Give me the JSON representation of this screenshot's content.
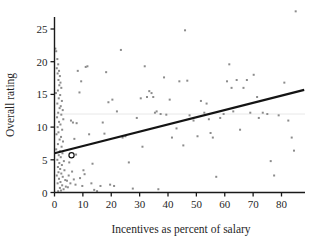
{
  "chart_data": {
    "type": "scatter",
    "title": "",
    "subtitle": "",
    "xlabel": "Incentives as percent of salary",
    "ylabel": "Overall rating",
    "xlim": [
      -1.5,
      91
    ],
    "ylim": [
      -1.2,
      28.6
    ],
    "xticks": [
      0,
      10,
      20,
      30,
      40,
      50,
      60,
      70,
      80
    ],
    "yticks": [
      0,
      5,
      10,
      15,
      20,
      25
    ],
    "xtick_labels": [
      "0",
      "10",
      "20",
      "30",
      "40",
      "50",
      "60",
      "70",
      "80"
    ],
    "ytick_labels": [
      "0",
      "5",
      "10",
      "15",
      "20",
      "25"
    ],
    "grid": false,
    "legend": null,
    "marker_color": "#8c8c8c",
    "line_color": "#1a1a1a",
    "axis_color": "#1a1a1a",
    "gridline_color": "#e2e2e2",
    "reference_line": {
      "orientation": "horizontal",
      "y": 12.0,
      "color": "#e8e8e8"
    },
    "trend_line": {
      "type": "linear-regression",
      "x_start": 0.0,
      "y_start": 6.0,
      "x_end": 88.0,
      "y_end": 15.7,
      "slope": 0.11,
      "intercept": 6.0,
      "color": "#141414",
      "width": 2.2
    },
    "highlighted_point": {
      "x": 6.0,
      "y": 5.7,
      "style": "open-circle",
      "color": "#111111"
    },
    "points": [
      [
        0.3,
        22.0
      ],
      [
        0.6,
        21.6
      ],
      [
        1.0,
        20.4
      ],
      [
        1.3,
        19.6
      ],
      [
        0.8,
        19.0
      ],
      [
        1.6,
        18.6
      ],
      [
        1.1,
        18.2
      ],
      [
        1.9,
        17.8
      ],
      [
        1.4,
        17.2
      ],
      [
        2.1,
        16.8
      ],
      [
        1.7,
        16.4
      ],
      [
        2.4,
        16.0
      ],
      [
        1.2,
        15.6
      ],
      [
        0.5,
        15.2
      ],
      [
        2.0,
        14.9
      ],
      [
        1.5,
        14.4
      ],
      [
        2.6,
        14.0
      ],
      [
        1.0,
        13.6
      ],
      [
        2.2,
        13.2
      ],
      [
        1.8,
        12.9
      ],
      [
        2.9,
        12.6
      ],
      [
        1.3,
        12.2
      ],
      [
        2.4,
        11.9
      ],
      [
        0.9,
        11.5
      ],
      [
        3.1,
        11.2
      ],
      [
        1.6,
        10.8
      ],
      [
        2.1,
        10.4
      ],
      [
        1.1,
        10.0
      ],
      [
        2.7,
        9.6
      ],
      [
        1.4,
        9.2
      ],
      [
        0.7,
        8.9
      ],
      [
        2.3,
        8.5
      ],
      [
        1.8,
        8.1
      ],
      [
        3.0,
        7.8
      ],
      [
        1.2,
        7.4
      ],
      [
        2.5,
        7.0
      ],
      [
        0.6,
        6.6
      ],
      [
        1.9,
        6.3
      ],
      [
        2.8,
        6.0
      ],
      [
        1.5,
        5.7
      ],
      [
        2.2,
        5.4
      ],
      [
        1.0,
        5.0
      ],
      [
        3.3,
        4.8
      ],
      [
        1.7,
        4.5
      ],
      [
        2.6,
        4.2
      ],
      [
        1.2,
        3.9
      ],
      [
        2.0,
        3.6
      ],
      [
        3.5,
        3.4
      ],
      [
        1.4,
        3.1
      ],
      [
        2.4,
        2.9
      ],
      [
        0.8,
        2.6
      ],
      [
        2.9,
        2.4
      ],
      [
        1.6,
        2.1
      ],
      [
        3.8,
        1.9
      ],
      [
        2.1,
        1.6
      ],
      [
        1.1,
        1.4
      ],
      [
        2.7,
        1.1
      ],
      [
        4.0,
        0.9
      ],
      [
        1.9,
        0.7
      ],
      [
        3.2,
        0.5
      ],
      [
        2.3,
        0.3
      ],
      [
        1.3,
        0.2
      ],
      [
        4.4,
        1.8
      ],
      [
        5.0,
        2.6
      ],
      [
        4.7,
        0.8
      ],
      [
        5.6,
        1.4
      ],
      [
        6.2,
        3.2
      ],
      [
        5.2,
        4.6
      ],
      [
        6.8,
        2.0
      ],
      [
        7.4,
        1.2
      ],
      [
        6.0,
        5.7
      ],
      [
        7.0,
        8.2
      ],
      [
        6.5,
        10.7
      ],
      [
        5.8,
        11.0
      ],
      [
        7.6,
        5.8
      ],
      [
        8.2,
        18.6
      ],
      [
        8.8,
        15.3
      ],
      [
        9.4,
        17.0
      ],
      [
        7.8,
        10.6
      ],
      [
        9.0,
        2.2
      ],
      [
        10.2,
        3.4
      ],
      [
        9.8,
        1.0
      ],
      [
        11.0,
        19.2
      ],
      [
        11.6,
        19.3
      ],
      [
        10.6,
        2.8
      ],
      [
        12.2,
        8.9
      ],
      [
        13.0,
        1.4
      ],
      [
        14.0,
        0.4
      ],
      [
        13.4,
        4.4
      ],
      [
        15.0,
        0.2
      ],
      [
        16.2,
        1.0
      ],
      [
        17.0,
        10.7
      ],
      [
        17.6,
        9.0
      ],
      [
        18.2,
        18.4
      ],
      [
        19.0,
        13.8
      ],
      [
        19.6,
        1.2
      ],
      [
        20.4,
        14.2
      ],
      [
        21.0,
        1.0
      ],
      [
        22.0,
        12.4
      ],
      [
        23.4,
        21.8
      ],
      [
        24.0,
        8.4
      ],
      [
        25.0,
        8.6
      ],
      [
        26.2,
        4.6
      ],
      [
        27.6,
        0.6
      ],
      [
        29.0,
        11.4
      ],
      [
        30.4,
        14.4
      ],
      [
        31.0,
        7.0
      ],
      [
        31.8,
        19.3
      ],
      [
        32.6,
        14.6
      ],
      [
        33.4,
        15.5
      ],
      [
        34.2,
        15.2
      ],
      [
        34.8,
        14.6
      ],
      [
        35.4,
        12.2
      ],
      [
        36.0,
        12.4
      ],
      [
        36.6,
        0.5
      ],
      [
        37.4,
        12.0
      ],
      [
        38.6,
        17.6
      ],
      [
        39.4,
        11.9
      ],
      [
        40.6,
        14.2
      ],
      [
        41.4,
        8.4
      ],
      [
        43.0,
        9.8
      ],
      [
        44.0,
        17.0
      ],
      [
        45.4,
        7.2
      ],
      [
        46.0,
        24.8
      ],
      [
        46.8,
        17.1
      ],
      [
        47.6,
        11.8
      ],
      [
        49.0,
        11.0
      ],
      [
        50.4,
        8.6
      ],
      [
        51.6,
        14.0
      ],
      [
        52.8,
        12.2
      ],
      [
        53.6,
        13.6
      ],
      [
        54.4,
        11.2
      ],
      [
        55.0,
        9.1
      ],
      [
        55.8,
        8.4
      ],
      [
        57.0,
        2.4
      ],
      [
        58.4,
        11.4
      ],
      [
        59.6,
        12.0
      ],
      [
        60.8,
        17.0
      ],
      [
        61.6,
        19.6
      ],
      [
        62.4,
        16.0
      ],
      [
        63.0,
        12.4
      ],
      [
        64.2,
        17.2
      ],
      [
        65.4,
        9.6
      ],
      [
        66.6,
        16.0
      ],
      [
        67.8,
        17.2
      ],
      [
        69.0,
        12.2
      ],
      [
        70.2,
        18.0
      ],
      [
        71.4,
        14.6
      ],
      [
        72.0,
        11.4
      ],
      [
        73.4,
        12.2
      ],
      [
        75.0,
        12.0
      ],
      [
        76.2,
        4.8
      ],
      [
        77.4,
        2.6
      ],
      [
        79.0,
        11.8
      ],
      [
        81.0,
        16.8
      ],
      [
        82.4,
        11.0
      ],
      [
        83.6,
        8.4
      ],
      [
        84.4,
        6.4
      ],
      [
        85.0,
        27.7
      ]
    ]
  }
}
